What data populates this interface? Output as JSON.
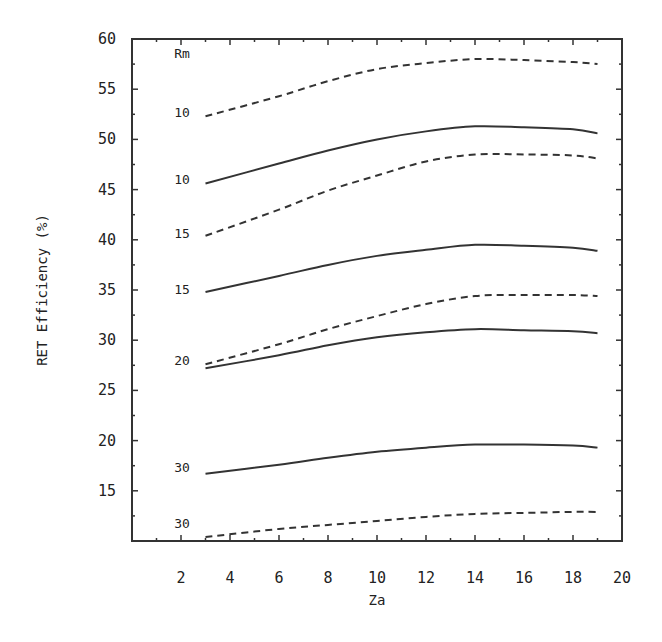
{
  "chart_data": {
    "type": "line",
    "title": "",
    "xlabel": "Za",
    "ylabel": "RET Efficiency (%)",
    "xlim": [
      0,
      20
    ],
    "ylim": [
      10,
      60
    ],
    "x_ticks": [
      2,
      4,
      6,
      8,
      10,
      12,
      14,
      16,
      18,
      20
    ],
    "y_ticks": [
      15,
      20,
      25,
      30,
      35,
      40,
      45,
      50,
      55,
      60
    ],
    "grid": false,
    "legend": {
      "title": "Rm",
      "position": "inline-left"
    },
    "x": [
      3,
      6,
      8,
      10,
      12,
      14,
      16,
      18,
      19
    ],
    "series": [
      {
        "name": "Rm 10 (dashed)",
        "label": "10",
        "style": "dashed",
        "values": [
          52.3,
          54.3,
          55.8,
          57.0,
          57.6,
          58.0,
          57.9,
          57.7,
          57.5
        ]
      },
      {
        "name": "Rm 10 (solid)",
        "label": "10",
        "style": "solid",
        "values": [
          45.6,
          47.6,
          48.9,
          50.0,
          50.8,
          51.3,
          51.2,
          51.0,
          50.6
        ]
      },
      {
        "name": "Rm 15 (dashed)",
        "label": "15",
        "style": "dashed",
        "values": [
          40.4,
          43.0,
          44.9,
          46.4,
          47.8,
          48.5,
          48.5,
          48.4,
          48.1
        ]
      },
      {
        "name": "Rm 15 (solid)",
        "label": "15",
        "style": "solid",
        "values": [
          34.8,
          36.4,
          37.5,
          38.4,
          39.0,
          39.5,
          39.4,
          39.2,
          38.9
        ]
      },
      {
        "name": "Rm 20 (dashed)",
        "label": "20",
        "style": "dashed",
        "values": [
          27.6,
          29.6,
          31.1,
          32.4,
          33.6,
          34.4,
          34.5,
          34.5,
          34.4
        ]
      },
      {
        "name": "Rm 20 (solid)",
        "label": "20",
        "style": "solid",
        "values": [
          27.2,
          28.5,
          29.5,
          30.3,
          30.8,
          31.1,
          31.0,
          30.9,
          30.7
        ]
      },
      {
        "name": "Rm 30 (solid)",
        "label": "30",
        "style": "solid",
        "values": [
          16.7,
          17.6,
          18.3,
          18.9,
          19.3,
          19.6,
          19.6,
          19.5,
          19.3
        ]
      },
      {
        "name": "Rm 30 (dashed)",
        "label": "30",
        "style": "dashed",
        "values": [
          10.4,
          11.2,
          11.6,
          12.0,
          12.4,
          12.7,
          12.8,
          12.9,
          12.9
        ]
      }
    ],
    "inline_labels": [
      {
        "text": "Rm",
        "y": 58.6
      },
      {
        "text": "10",
        "y": 52.7
      },
      {
        "text": "10",
        "y": 46.1
      },
      {
        "text": "15",
        "y": 40.7
      },
      {
        "text": "15",
        "y": 35.1
      },
      {
        "text": "20",
        "y": 28.0
      },
      {
        "text": "30",
        "y": 17.4
      },
      {
        "text": "30",
        "y": 11.8
      }
    ]
  },
  "colors": {
    "line": "#333333",
    "text": "#222222",
    "background": "#ffffff"
  }
}
